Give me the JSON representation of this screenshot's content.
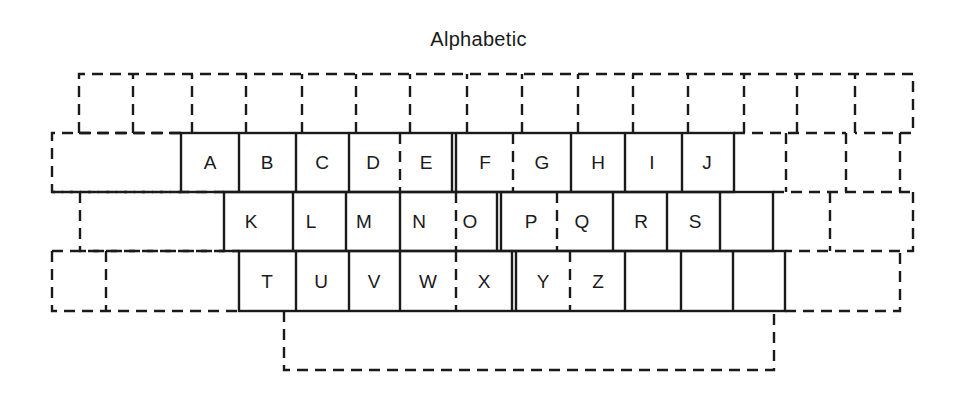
{
  "title": "Alphabetic",
  "rows": [
    {
      "name": "number-row",
      "keys": [
        "",
        "",
        "",
        "",
        "",
        "",
        "",
        "",
        "",
        "",
        "",
        "",
        "",
        "",
        ""
      ]
    },
    {
      "name": "top-letter-row",
      "keys": [
        "A",
        "B",
        "C",
        "D",
        "E",
        "F",
        "G",
        "H",
        "I",
        "J",
        ""
      ]
    },
    {
      "name": "home-row",
      "keys": [
        "K",
        "L",
        "M",
        "N",
        "O",
        "P",
        "Q",
        "R",
        "S",
        ""
      ]
    },
    {
      "name": "bottom-row",
      "keys": [
        "T",
        "U",
        "V",
        "W",
        "X",
        "Y",
        "Z",
        "",
        "",
        ""
      ]
    }
  ],
  "space_bar": ""
}
